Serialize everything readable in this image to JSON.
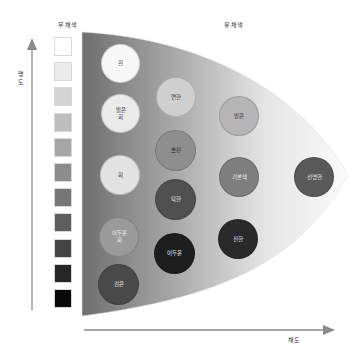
{
  "headers": {
    "achromatic": "무채색",
    "chromatic": "유채색"
  },
  "axes": {
    "y_label": "명도",
    "y_label_line1": "명",
    "y_label_line2": "도",
    "x_label": "채도"
  },
  "swatches": [
    "#ffffff",
    "#ebebeb",
    "#d4d4d4",
    "#bebebe",
    "#a6a6a6",
    "#8c8c8c",
    "#777777",
    "#5e5e5e",
    "#444444",
    "#262626",
    "#0a0a0a"
  ],
  "achromatic_tones": [
    {
      "label_line1": "흰",
      "label_line2": "",
      "fill": "#f7f7f7",
      "text": "#333333"
    },
    {
      "label_line1": "밝은",
      "label_line2": "회",
      "fill": "#eaeaea",
      "text": "#333333"
    },
    {
      "label_line1": "회",
      "label_line2": "",
      "fill": "#e2e2e2",
      "text": "#333333"
    },
    {
      "label_line1": "어두운",
      "label_line2": "회",
      "fill": "#9a9a9a",
      "text": "#f0f0f0"
    },
    {
      "label_line1": "검은",
      "label_line2": "",
      "fill": "#4a4a4a",
      "text": "#f0f0f0"
    }
  ],
  "chromatic_tones": [
    {
      "label": "연한",
      "fill": "#cfcfcf",
      "text": "#333333"
    },
    {
      "label": "흐린",
      "fill": "#8e8e8e",
      "text": "#222222"
    },
    {
      "label": "탁한",
      "fill": "#505050",
      "text": "#f0f0f0"
    },
    {
      "label": "어두운",
      "fill": "#1e1e1e",
      "text": "#f0f0f0"
    },
    {
      "label": "밝은",
      "fill": "#b5b5b5",
      "text": "#333333"
    },
    {
      "label": "기본색",
      "fill": "#7e7e7e",
      "text": "#f0f0f0"
    },
    {
      "label": "진한",
      "fill": "#2a2a2a",
      "text": "#f0f0f0"
    },
    {
      "label": "선명한",
      "fill": "#5a5a5a",
      "text": "#f0f0f0"
    }
  ]
}
